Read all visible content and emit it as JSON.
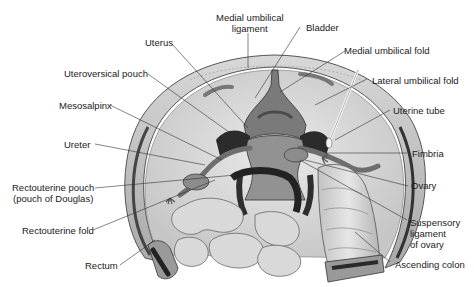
{
  "figure": {
    "labels": {
      "medial_umbilical_ligament_1": "Medial umbilical",
      "medial_umbilical_ligament_2": "ligament",
      "bladder": "Bladder",
      "uterus": "Uterus",
      "medial_umbilical_fold": "Medial umbilical fold",
      "uterovesical_pouch": "Uteroversical pouch",
      "lateral_umbilical_fold": "Lateral umbilical fold",
      "mesosalpinx": "Mesosalpinx",
      "uterine_tube": "Uterine tube",
      "ureter": "Ureter",
      "fimbria": "Fimbria",
      "rectouterine_pouch_1": "Rectouterine pouch",
      "rectouterine_pouch_2": "(pouch of Douglas)",
      "ovary": "Ovary",
      "rectouterine_fold": "Rectouterine fold",
      "suspensory_ligament_1": "Suspensory",
      "suspensory_ligament_2": "ligament",
      "suspensory_ligament_3": "of ovary",
      "rectum": "Rectum",
      "ascending_colon": "Ascending colon"
    },
    "colors": {
      "line": "#333333",
      "dark_tissue": "#3a3a3a",
      "mid_tissue": "#8a8a8a",
      "light_tissue": "#d4d4d4",
      "wall": "#bcbcbc"
    }
  }
}
